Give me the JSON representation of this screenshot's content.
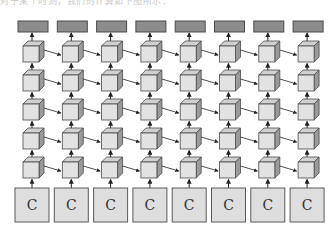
{
  "caption": "对于某个时刻，我们的计算如下图所示：",
  "diagram": {
    "columns": 8,
    "hidden_rows": 5,
    "input_label": "C",
    "colors": {
      "output_fill": "#8c8c8c",
      "output_stroke": "#4a4a4a",
      "cube_front": "#e2e2e2",
      "cube_top": "#d0d0d0",
      "cube_side": "#9a9a9a",
      "cube_stroke": "#4a4a4a",
      "input_fill": "#dedede",
      "input_stroke": "#5a5a5a",
      "arrow": "#222222"
    },
    "nodes": {
      "output": "output-box",
      "hidden": "cube-cell",
      "input": "C"
    }
  }
}
